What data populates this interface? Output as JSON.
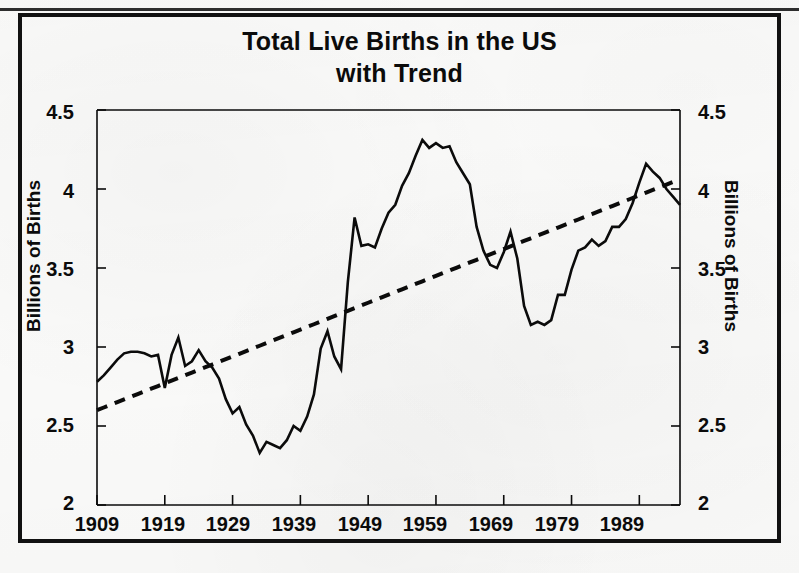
{
  "figure": {
    "title_line1": "Total Live Births in the US",
    "title_line2": "with Trend"
  },
  "axes": {
    "y_label_left": "Billions of Births",
    "y_label_right": "Billions of Births",
    "y_ticks": [
      "2",
      "2.5",
      "3",
      "3.5",
      "4",
      "4.5"
    ],
    "x_ticks": [
      "1909",
      "1919",
      "1929",
      "1939",
      "1949",
      "1959",
      "1969",
      "1979",
      "1989"
    ]
  },
  "colors": {
    "ink": "#0b0b0b",
    "frame": "#111111",
    "paper": "#fbfbfa"
  },
  "chart_data": {
    "type": "line",
    "title": "Total Live Births in the US with Trend",
    "xlabel": "",
    "ylabel": "Billions of Births",
    "xlim": [
      1909,
      1995
    ],
    "ylim": [
      2,
      4.5
    ],
    "grid": false,
    "legend": "none",
    "y_tick_values": [
      2,
      2.5,
      3,
      3.5,
      4,
      4.5
    ],
    "x_tick_values": [
      1909,
      1919,
      1929,
      1939,
      1949,
      1959,
      1969,
      1979,
      1989
    ],
    "x": [
      1909,
      1910,
      1911,
      1912,
      1913,
      1914,
      1915,
      1916,
      1917,
      1918,
      1919,
      1920,
      1921,
      1922,
      1923,
      1924,
      1925,
      1926,
      1927,
      1928,
      1929,
      1930,
      1931,
      1932,
      1933,
      1934,
      1935,
      1936,
      1937,
      1938,
      1939,
      1940,
      1941,
      1942,
      1943,
      1944,
      1945,
      1946,
      1947,
      1948,
      1949,
      1950,
      1951,
      1952,
      1953,
      1954,
      1955,
      1956,
      1957,
      1958,
      1959,
      1960,
      1961,
      1962,
      1963,
      1964,
      1965,
      1966,
      1967,
      1968,
      1969,
      1970,
      1971,
      1972,
      1973,
      1974,
      1975,
      1976,
      1977,
      1978,
      1979,
      1980,
      1981,
      1982,
      1983,
      1984,
      1985,
      1986,
      1987,
      1988,
      1989,
      1990,
      1991,
      1992,
      1993,
      1994,
      1995
    ],
    "series": [
      {
        "name": "Total Live Births",
        "style": "solid",
        "values": [
          2.78,
          2.82,
          2.87,
          2.92,
          2.96,
          2.97,
          2.97,
          2.96,
          2.94,
          2.95,
          2.74,
          2.95,
          3.06,
          2.88,
          2.91,
          2.98,
          2.91,
          2.87,
          2.8,
          2.67,
          2.58,
          2.62,
          2.51,
          2.44,
          2.33,
          2.4,
          2.38,
          2.36,
          2.41,
          2.5,
          2.47,
          2.56,
          2.7,
          2.99,
          3.1,
          2.94,
          2.86,
          3.41,
          3.82,
          3.64,
          3.65,
          3.63,
          3.75,
          3.85,
          3.9,
          4.02,
          4.1,
          4.21,
          4.31,
          4.26,
          4.29,
          4.26,
          4.27,
          4.17,
          4.1,
          4.03,
          3.76,
          3.61,
          3.52,
          3.5,
          3.6,
          3.73,
          3.56,
          3.26,
          3.14,
          3.16,
          3.14,
          3.17,
          3.33,
          3.33,
          3.49,
          3.61,
          3.63,
          3.68,
          3.64,
          3.67,
          3.76,
          3.76,
          3.81,
          3.91,
          4.04,
          4.16,
          4.11,
          4.07,
          4.0,
          3.95,
          3.9
        ]
      },
      {
        "name": "Trend",
        "style": "dashed",
        "values": [
          2.6,
          2.617,
          2.634,
          2.651,
          2.668,
          2.685,
          2.702,
          2.719,
          2.736,
          2.753,
          2.77,
          2.787,
          2.804,
          2.821,
          2.838,
          2.855,
          2.872,
          2.889,
          2.906,
          2.923,
          2.94,
          2.957,
          2.974,
          2.991,
          3.008,
          3.025,
          3.042,
          3.059,
          3.076,
          3.093,
          3.11,
          3.127,
          3.144,
          3.161,
          3.178,
          3.195,
          3.212,
          3.229,
          3.246,
          3.263,
          3.28,
          3.297,
          3.314,
          3.331,
          3.348,
          3.365,
          3.382,
          3.399,
          3.416,
          3.433,
          3.45,
          3.467,
          3.484,
          3.501,
          3.518,
          3.535,
          3.552,
          3.569,
          3.586,
          3.603,
          3.62,
          3.637,
          3.654,
          3.671,
          3.688,
          3.705,
          3.722,
          3.739,
          3.756,
          3.773,
          3.79,
          3.807,
          3.824,
          3.841,
          3.858,
          3.875,
          3.892,
          3.909,
          3.926,
          3.943,
          3.96,
          3.977,
          3.994,
          4.011,
          4.028,
          4.045,
          4.06
        ]
      }
    ]
  }
}
